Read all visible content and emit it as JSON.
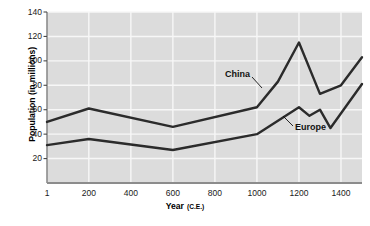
{
  "chart_data": {
    "type": "line",
    "title": "",
    "xlabel": "Year (C.E.)",
    "ylabel": "Population (in millions)",
    "xlim": [
      1,
      1500
    ],
    "ylim": [
      0,
      140
    ],
    "grid": true,
    "legend": "inline-labels",
    "plot_background": "#dcdcdc",
    "x_ticks": [
      {
        "value": 1,
        "label": "1"
      },
      {
        "value": 200,
        "label": "200"
      },
      {
        "value": 400,
        "label": "400"
      },
      {
        "value": 600,
        "label": "600"
      },
      {
        "value": 800,
        "label": "800"
      },
      {
        "value": 1000,
        "label": "1000"
      },
      {
        "value": 1200,
        "label": "1200"
      },
      {
        "value": 1400,
        "label": "1400"
      }
    ],
    "y_ticks": [
      {
        "value": 20,
        "label": "20"
      },
      {
        "value": 40,
        "label": "40"
      },
      {
        "value": 60,
        "label": "60"
      },
      {
        "value": 80,
        "label": "80"
      },
      {
        "value": 100,
        "label": "100"
      },
      {
        "value": 120,
        "label": "120"
      },
      {
        "value": 140,
        "label": "140"
      }
    ],
    "series": [
      {
        "name": "China",
        "label": "China",
        "color": "#2b2b2b",
        "x": [
          1,
          200,
          600,
          1000,
          1100,
          1200,
          1300,
          1400,
          1500
        ],
        "values": [
          50,
          61,
          46,
          62,
          83,
          115,
          73,
          80,
          103
        ]
      },
      {
        "name": "Europe",
        "label": "Europe",
        "color": "#2b2b2b",
        "x": [
          1,
          200,
          600,
          1000,
          1200,
          1250,
          1300,
          1350,
          1500
        ],
        "values": [
          31,
          36,
          27,
          40,
          62,
          55,
          60,
          45,
          81
        ]
      }
    ],
    "annotations": [
      {
        "name": "china-leader",
        "from_series": "China",
        "text": "China"
      },
      {
        "name": "europe-leader",
        "from_series": "Europe",
        "text": "Europe"
      }
    ]
  },
  "axis": {
    "x_title_main": "Year",
    "x_title_unit": "(C.E.)",
    "y_title": "Population (in millions)"
  }
}
